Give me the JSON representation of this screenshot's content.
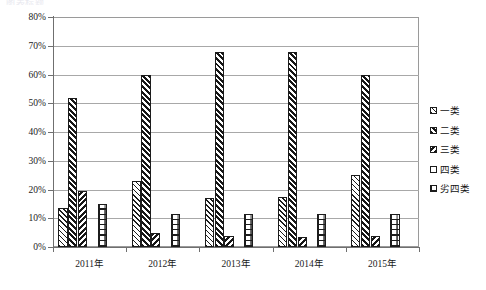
{
  "top_caption": "图表标题",
  "chart_data": {
    "type": "bar",
    "title": "",
    "subtitle": "",
    "xlabel": "",
    "ylabel": "",
    "ylim": [
      0,
      80
    ],
    "ytick_step": 10,
    "ytick_labels": [
      "80%",
      "70%",
      "60%",
      "50%",
      "40%",
      "30%",
      "20%",
      "10%",
      "0%"
    ],
    "ytick_values": [
      80,
      70,
      60,
      50,
      40,
      30,
      20,
      10,
      0
    ],
    "grid": true,
    "grid_axis": "y",
    "legend_position": "right",
    "categories": [
      "2011年",
      "2012年",
      "2013年",
      "2014年",
      "2015年"
    ],
    "series": [
      {
        "name": "一类",
        "pattern": "diagonal-hatch-light",
        "values": [
          13.5,
          23.0,
          17.0,
          17.5,
          25.0
        ]
      },
      {
        "name": "二类",
        "pattern": "diagonal-hatch-dense",
        "values": [
          52.0,
          60.0,
          68.0,
          68.0,
          60.0
        ]
      },
      {
        "name": "三类",
        "pattern": "reverse-diagonal-hatch",
        "values": [
          19.5,
          5.0,
          4.0,
          3.5,
          4.0
        ]
      },
      {
        "name": "四类",
        "pattern": "solid-white",
        "values": [
          0,
          0,
          0,
          0,
          0
        ]
      },
      {
        "name": "劣四类",
        "pattern": "brick",
        "values": [
          15.0,
          11.5,
          11.5,
          11.5,
          11.5
        ]
      }
    ],
    "units": "percent"
  },
  "legend": {
    "items": [
      {
        "label": "一类"
      },
      {
        "label": "二类"
      },
      {
        "label": "三类"
      },
      {
        "label": "四类"
      },
      {
        "label": "劣四类"
      }
    ]
  },
  "colors": {
    "axis": "#6f6f6f",
    "gridline": "#a8a8a8",
    "bar_outline": "#1c1c1c",
    "bar_fill": "#ffffff",
    "text": "#1a1a1a",
    "background": "#ffffff"
  }
}
